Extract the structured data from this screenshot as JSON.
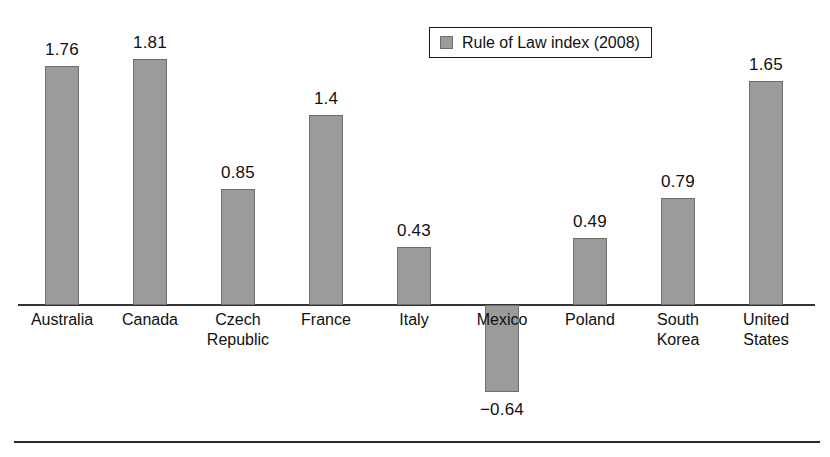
{
  "chart_data": {
    "type": "bar",
    "title": "",
    "subtitle": "",
    "xlabel": "",
    "ylabel": "",
    "grid": false,
    "legend_position": "top-right",
    "axis_zero_line": true,
    "ylim": [
      -0.9,
      2.0
    ],
    "categories": [
      "Australia",
      "Canada",
      "Czech Republic",
      "France",
      "Italy",
      "Mexico",
      "Poland",
      "South Korea",
      "United States"
    ],
    "category_lines": [
      [
        "Australia",
        ""
      ],
      [
        "Canada",
        ""
      ],
      [
        "Czech",
        "Republic"
      ],
      [
        "France",
        ""
      ],
      [
        "Italy",
        ""
      ],
      [
        "Mexico",
        ""
      ],
      [
        "Poland",
        ""
      ],
      [
        "South",
        "Korea"
      ],
      [
        "United",
        "States"
      ]
    ],
    "values": [
      1.76,
      1.81,
      0.85,
      1.4,
      0.43,
      -0.64,
      0.49,
      0.79,
      1.65
    ],
    "value_labels": [
      "1.76",
      "1.81",
      "0.85",
      "1.4",
      "0.43",
      "−0.64",
      "0.49",
      "0.79",
      "1.65"
    ],
    "series": [
      {
        "name": "Rule of Law index (2008)",
        "values": [
          1.76,
          1.81,
          0.85,
          1.4,
          0.43,
          -0.64,
          0.49,
          0.79,
          1.65
        ]
      }
    ],
    "colors": {
      "bar_fill": "#9b9b9b",
      "bar_stroke": "#6f6f6f",
      "axis": "#333333",
      "text": "#111111",
      "background": "#ffffff"
    }
  },
  "legend": {
    "label": "Rule of Law index (2008)",
    "swatch_color": "#9b9b9b"
  }
}
